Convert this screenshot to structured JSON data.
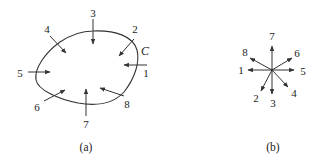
{
  "figure_a": {
    "caption": "(a)",
    "curve_label": "C",
    "arrows": [
      {
        "label": "1",
        "from": [
          147,
          65
        ],
        "to": [
          124,
          65
        ],
        "label_pos": [
          146,
          73
        ]
      },
      {
        "label": "2",
        "from": [
          134,
          39
        ],
        "to": [
          119,
          56
        ],
        "label_pos": [
          135,
          29
        ]
      },
      {
        "label": "3",
        "from": [
          93,
          19
        ],
        "to": [
          93,
          44
        ],
        "label_pos": [
          93,
          13
        ]
      },
      {
        "label": "4",
        "from": [
          50,
          36
        ],
        "to": [
          66,
          53
        ],
        "label_pos": [
          47,
          29
        ]
      },
      {
        "label": "5",
        "from": [
          28,
          72
        ],
        "to": [
          50,
          72
        ],
        "label_pos": [
          20,
          73
        ]
      },
      {
        "label": "6",
        "from": [
          44,
          101
        ],
        "to": [
          65,
          90
        ],
        "label_pos": [
          37,
          107
        ]
      },
      {
        "label": "7",
        "from": [
          86,
          116
        ],
        "to": [
          86,
          89
        ],
        "label_pos": [
          86,
          124
        ]
      },
      {
        "label": "8",
        "from": [
          124,
          96
        ],
        "to": [
          100,
          88
        ],
        "label_pos": [
          127,
          104
        ]
      }
    ]
  },
  "figure_b": {
    "caption": "(b)",
    "center": [
      272,
      70
    ],
    "arrows": [
      {
        "label": "1",
        "to": [
          248,
          70
        ],
        "label_pos": [
          241,
          70
        ]
      },
      {
        "label": "2",
        "to": [
          261,
          91
        ],
        "label_pos": [
          256,
          98
        ]
      },
      {
        "label": "3",
        "to": [
          272,
          94
        ],
        "label_pos": [
          273,
          103
        ]
      },
      {
        "label": "4",
        "to": [
          288,
          87
        ],
        "label_pos": [
          294,
          93
        ]
      },
      {
        "label": "5",
        "to": [
          294,
          70
        ],
        "label_pos": [
          303,
          71
        ]
      },
      {
        "label": "6",
        "to": [
          292,
          58
        ],
        "label_pos": [
          297,
          53
        ]
      },
      {
        "label": "7",
        "to": [
          272,
          46
        ],
        "label_pos": [
          272,
          36
        ]
      },
      {
        "label": "8",
        "to": [
          250,
          58
        ],
        "label_pos": [
          245,
          52
        ]
      }
    ]
  },
  "colors": {
    "stroke": "#333333",
    "text": "#222222",
    "background": "#ffffff"
  }
}
